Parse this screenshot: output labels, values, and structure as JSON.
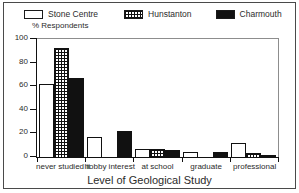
{
  "chart_data": {
    "type": "bar",
    "title": "",
    "xlabel": "Level of Geological Study",
    "ylabel": "% Respondents",
    "ylim": [
      0,
      100
    ],
    "yticks": [
      0,
      20,
      40,
      60,
      80,
      100
    ],
    "grid": false,
    "legend_position": "top",
    "categories": [
      "never studied it",
      "hobby interest",
      "at school",
      "graduate",
      "professional"
    ],
    "series": [
      {
        "name": "Stone Centre",
        "fill": "white",
        "color": "#ffffff",
        "values": [
          62,
          17,
          7,
          4,
          12
        ]
      },
      {
        "name": "Hunstanton",
        "fill": "grid",
        "color": "#111111",
        "values": [
          92,
          0,
          7,
          0,
          3
        ]
      },
      {
        "name": "Charmouth",
        "fill": "black",
        "color": "#111111",
        "values": [
          67,
          22,
          6,
          4,
          2
        ]
      }
    ]
  },
  "legend": {
    "entries": [
      {
        "label": "Stone Centre"
      },
      {
        "label": "Hunstanton"
      },
      {
        "label": "Charmouth"
      }
    ]
  },
  "axis": {
    "y_label": "% Respondents",
    "y_ticks": [
      "0",
      "20",
      "40",
      "60",
      "80",
      "100"
    ],
    "x_title": "Level of Geological Study",
    "x_categories": [
      "never studied it",
      "hobby interest",
      "at school",
      "graduate",
      "professional"
    ]
  }
}
